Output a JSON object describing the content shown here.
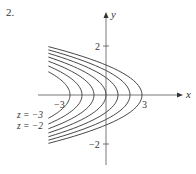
{
  "problem_number": "2.",
  "axes": {
    "x_label": "x",
    "y_label": "y",
    "x_ticks": [
      {
        "value": -3,
        "label": "−3"
      },
      {
        "value": 3,
        "label": "3"
      }
    ],
    "y_ticks": [
      {
        "value": 2,
        "label": "2"
      },
      {
        "value": -2,
        "label": "−2"
      }
    ]
  },
  "curve_labels": [
    {
      "text": "z = −3"
    },
    {
      "text": "z = −2"
    }
  ],
  "chart_data": {
    "type": "line",
    "xlabel": "x",
    "ylabel": "y",
    "xlim": [
      -5,
      5.5
    ],
    "ylim": [
      -3,
      3.4
    ],
    "grid": false,
    "series": [
      {
        "name": "z = -3",
        "vertex_x": -3
      },
      {
        "name": "z = -2",
        "vertex_x": -2
      },
      {
        "name": "z = -1",
        "vertex_x": -1
      },
      {
        "name": "z = 0",
        "vertex_x": 0
      },
      {
        "name": "z = 1",
        "vertex_x": 1
      },
      {
        "name": "z = 2",
        "vertex_x": 2
      },
      {
        "name": "z = 3",
        "vertex_x": 3
      }
    ],
    "annotations": [
      "z = −3",
      "z = −2"
    ],
    "curve_shape": "leftward-opening parabolas x = z - 2y^2, clipped at x ≈ -4.8"
  },
  "colors": {
    "axis": "#555555",
    "curve": "#333333",
    "text": "#333333"
  }
}
